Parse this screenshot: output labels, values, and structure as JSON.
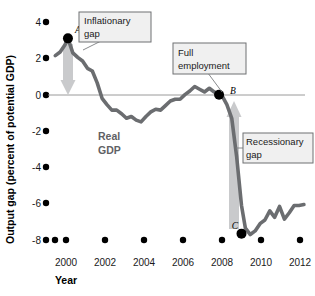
{
  "chart_data": {
    "type": "line",
    "title": "",
    "xlabel": "Year",
    "ylabel": "Output gap (percent of potential GDP)",
    "xlim": [
      1999.3,
      2012.6
    ],
    "ylim": [
      -8.6,
      4.6
    ],
    "grid": false,
    "legend": "none",
    "x_ticks": [
      "2000",
      "2002",
      "2004",
      "2006",
      "2008",
      "2010",
      "2012"
    ],
    "x_tick_values": [
      2000,
      2002,
      2004,
      2006,
      2008,
      2010,
      2012
    ],
    "y_ticks": [
      "4",
      "2",
      "0",
      "-2",
      "-4",
      "-6",
      "-8"
    ],
    "y_tick_values": [
      4,
      2,
      0,
      -2,
      -4,
      -6,
      -8
    ],
    "zero_line": 0,
    "series": [
      {
        "name": "Real GDP",
        "color": "#6b6d70",
        "x": [
          1999.45,
          1999.7,
          1999.95,
          2000.1,
          2000.35,
          2000.6,
          2000.85,
          2001.1,
          2001.35,
          2001.6,
          2001.85,
          2002.1,
          2002.35,
          2002.6,
          2002.85,
          2003.1,
          2003.35,
          2003.6,
          2003.85,
          2004.1,
          2004.35,
          2004.6,
          2004.85,
          2005.1,
          2005.35,
          2005.6,
          2005.85,
          2006.1,
          2006.35,
          2006.6,
          2006.85,
          2007.1,
          2007.35,
          2007.6,
          2007.85,
          2008.0,
          2008.25,
          2008.5,
          2008.75,
          2009.0,
          2009.2,
          2009.45,
          2009.7,
          2009.95,
          2010.2,
          2010.45,
          2010.7,
          2010.95,
          2011.2,
          2011.45,
          2011.7,
          2011.95,
          2012.2
        ],
        "y": [
          2.15,
          2.35,
          2.75,
          3.1,
          2.3,
          2.05,
          1.85,
          1.45,
          1.3,
          0.65,
          -0.2,
          -0.55,
          -0.85,
          -0.85,
          -1.05,
          -1.3,
          -1.2,
          -1.4,
          -1.5,
          -1.2,
          -0.95,
          -0.8,
          -0.85,
          -0.6,
          -0.35,
          -0.25,
          -0.25,
          0.0,
          0.2,
          0.45,
          0.3,
          0.15,
          0.35,
          0.15,
          0.0,
          -0.05,
          -0.55,
          -1.3,
          -3.4,
          -6.1,
          -7.35,
          -7.7,
          -7.5,
          -7.1,
          -6.9,
          -6.4,
          -6.75,
          -6.15,
          -6.85,
          -6.5,
          -6.1,
          -6.1,
          -6.05
        ]
      }
    ],
    "annotated_points": [
      {
        "id": "A",
        "label": "A",
        "x": 2000.1,
        "y": 3.1
      },
      {
        "id": "B",
        "label": "B",
        "x": 2007.85,
        "y": 0.0
      },
      {
        "id": "C",
        "label": "C",
        "x": 2009.0,
        "y": -7.65
      }
    ],
    "callouts": [
      {
        "id": "inflationary-gap",
        "line1": "Inflationary",
        "line2": "gap"
      },
      {
        "id": "full-employment",
        "line1": "Full",
        "line2": "employment"
      },
      {
        "id": "recessionary-gap",
        "line1": "Recessionary",
        "line2": "gap"
      }
    ],
    "series_label": {
      "line1": "Real",
      "line2": "GDP"
    },
    "gap_arrows": [
      {
        "id": "inflationary-gap-arrow",
        "direction": "down",
        "from_y": 2.85,
        "to_y": 0.0,
        "color": "#c9cacc"
      },
      {
        "id": "recessionary-gap-arrow",
        "direction": "up",
        "from_y": -7.4,
        "to_y": 0.0,
        "color": "#c9cacc"
      }
    ],
    "colors": {
      "line": "#6b6d70",
      "arrow": "#c9cacc",
      "zero_line": "#9a9a9a",
      "callout_border": "#6f7173",
      "callout_fill": "#f0f0f0",
      "marker": "#000000"
    }
  }
}
